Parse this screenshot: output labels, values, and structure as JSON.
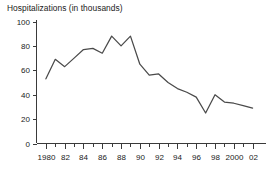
{
  "chart_data": {
    "type": "line",
    "title": "Hospitalizations (in thousands)",
    "xlabel": "",
    "ylabel": "",
    "grid": false,
    "legend": false,
    "legend_position": "none",
    "line_color": "#4a4a4a",
    "axis_color": "#3a3a3a",
    "background_color": "#ffffff",
    "xlim": [
      1979,
      2003
    ],
    "ylim": [
      0,
      100
    ],
    "yticks": [
      0,
      20,
      40,
      60,
      80,
      100
    ],
    "ytick_labels": [
      "0",
      "20",
      "40",
      "60",
      "80",
      "100"
    ],
    "xticks": [
      1980,
      1982,
      1984,
      1986,
      1988,
      1990,
      1992,
      1994,
      1996,
      1998,
      2000,
      2002
    ],
    "xtick_labels": [
      "1980",
      "82",
      "84",
      "86",
      "88",
      "90",
      "92",
      "94",
      "96",
      "98",
      "2000",
      "02"
    ],
    "minor_xticks": [
      1981,
      1983,
      1985,
      1987,
      1989,
      1991,
      1993,
      1995,
      1997,
      1999,
      2001
    ],
    "x": [
      1980,
      1981,
      1982,
      1983,
      1984,
      1985,
      1986,
      1987,
      1988,
      1989,
      1990,
      1991,
      1992,
      1993,
      1994,
      1995,
      1996,
      1997,
      1998,
      1999,
      2000,
      2001,
      2002
    ],
    "values": [
      53,
      69,
      63,
      70,
      77,
      78,
      74,
      88,
      80,
      88,
      65,
      56,
      57,
      50,
      45,
      42,
      38,
      25,
      40,
      34,
      33,
      31,
      29
    ],
    "series": [
      {
        "name": "Hospitalizations",
        "values": [
          53,
          69,
          63,
          70,
          77,
          78,
          74,
          88,
          80,
          88,
          65,
          56,
          57,
          50,
          45,
          42,
          38,
          25,
          40,
          34,
          33,
          31,
          29
        ]
      }
    ]
  }
}
